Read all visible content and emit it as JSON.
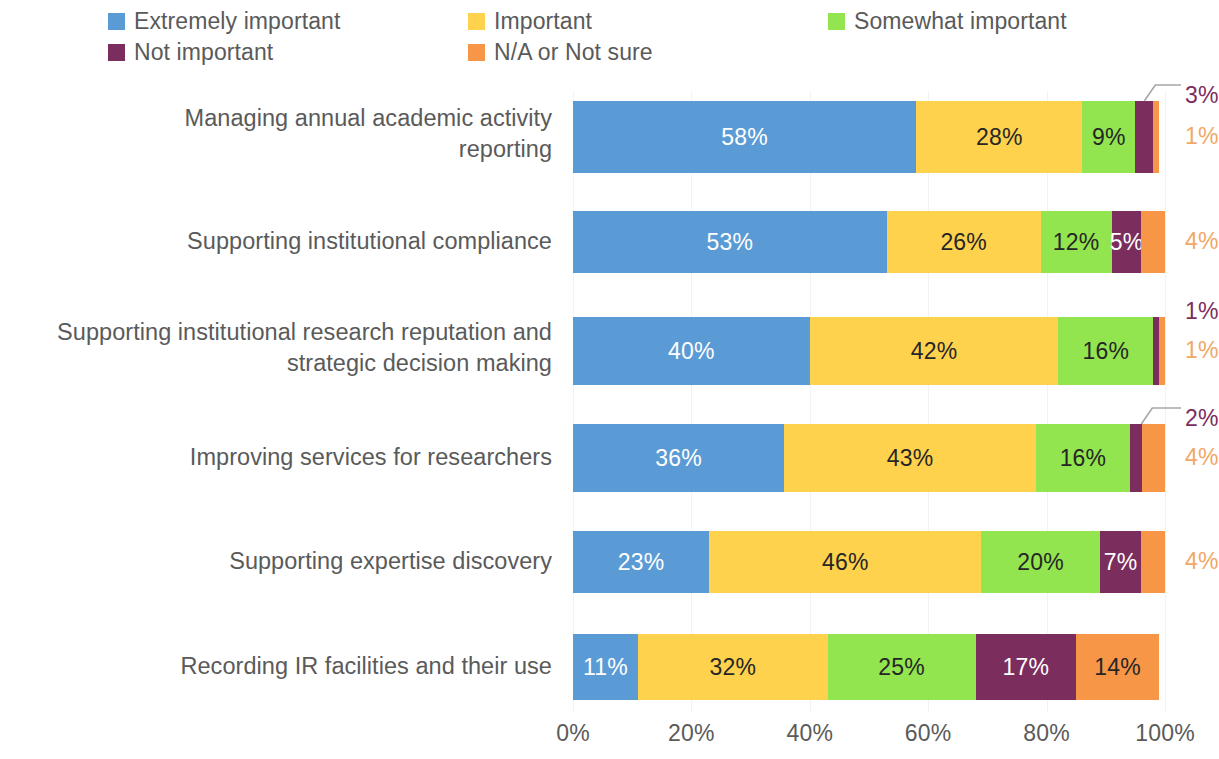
{
  "legend": {
    "items": [
      {
        "label": "Extremely important",
        "color": "#5B9BD5",
        "key": "extremely_important"
      },
      {
        "label": "Important",
        "color": "#FFD24D",
        "key": "important"
      },
      {
        "label": "Somewhat important",
        "color": "#92E54F",
        "key": "somewhat_important"
      },
      {
        "label": "Not important",
        "color": "#7B2D5E",
        "key": "not_important"
      },
      {
        "label": "N/A or Not sure",
        "color": "#F79646",
        "key": "na_not_sure"
      }
    ]
  },
  "axis": {
    "x_ticks": [
      "0%",
      "20%",
      "40%",
      "60%",
      "80%",
      "100%"
    ],
    "x_values": [
      0,
      20,
      40,
      60,
      80,
      100
    ]
  },
  "categories": [
    {
      "label": "Managing annual academic activity reporting"
    },
    {
      "label": "Supporting institutional compliance"
    },
    {
      "label": "Supporting institutional research reputation and strategic decision making"
    },
    {
      "label": "Improving services for researchers"
    },
    {
      "label": "Supporting expertise discovery"
    },
    {
      "label": "Recording IR facilities and their use"
    }
  ],
  "rows": [
    {
      "category": "Managing annual academic activity reporting",
      "segments": [
        {
          "series": "Extremely important",
          "value": 58,
          "text": "58%",
          "placement": "inside",
          "text_color": "#ffffff"
        },
        {
          "series": "Important",
          "value": 28,
          "text": "28%",
          "placement": "inside",
          "text_color": "#262626"
        },
        {
          "series": "Somewhat important",
          "value": 9,
          "text": "9%",
          "placement": "inside",
          "text_color": "#262626"
        },
        {
          "series": "Not important",
          "value": 3,
          "text": "3%",
          "placement": "callout",
          "text_color": "#7B2D5E"
        },
        {
          "series": "N/A or Not sure",
          "value": 1,
          "text": "1%",
          "placement": "outside",
          "text_color": "#F0A868"
        }
      ]
    },
    {
      "category": "Supporting institutional compliance",
      "segments": [
        {
          "series": "Extremely important",
          "value": 53,
          "text": "53%",
          "placement": "inside",
          "text_color": "#ffffff"
        },
        {
          "series": "Important",
          "value": 26,
          "text": "26%",
          "placement": "inside",
          "text_color": "#262626"
        },
        {
          "series": "Somewhat important",
          "value": 12,
          "text": "12%",
          "placement": "inside",
          "text_color": "#262626"
        },
        {
          "series": "Not important",
          "value": 5,
          "text": "5%",
          "placement": "inside",
          "text_color": "#ffffff"
        },
        {
          "series": "N/A or Not sure",
          "value": 4,
          "text": "4%",
          "placement": "outside",
          "text_color": "#F0A868"
        }
      ]
    },
    {
      "category": "Supporting institutional research reputation and strategic decision making",
      "segments": [
        {
          "series": "Extremely important",
          "value": 40,
          "text": "40%",
          "placement": "inside",
          "text_color": "#ffffff"
        },
        {
          "series": "Important",
          "value": 42,
          "text": "42%",
          "placement": "inside",
          "text_color": "#262626"
        },
        {
          "series": "Somewhat important",
          "value": 16,
          "text": "16%",
          "placement": "inside",
          "text_color": "#262626"
        },
        {
          "series": "Not important",
          "value": 1,
          "text": "1%",
          "placement": "outside",
          "text_color": "#7B2D5E"
        },
        {
          "series": "N/A or Not sure",
          "value": 1,
          "text": "1%",
          "placement": "outside",
          "text_color": "#F0A868"
        }
      ]
    },
    {
      "category": "Improving services for researchers",
      "segments": [
        {
          "series": "Extremely important",
          "value": 36,
          "text": "36%",
          "placement": "inside",
          "text_color": "#ffffff"
        },
        {
          "series": "Important",
          "value": 43,
          "text": "43%",
          "placement": "inside",
          "text_color": "#262626"
        },
        {
          "series": "Somewhat important",
          "value": 16,
          "text": "16%",
          "placement": "inside",
          "text_color": "#262626"
        },
        {
          "series": "Not important",
          "value": 2,
          "text": "2%",
          "placement": "callout",
          "text_color": "#7B2D5E"
        },
        {
          "series": "N/A or Not sure",
          "value": 4,
          "text": "4%",
          "placement": "outside",
          "text_color": "#F0A868"
        }
      ]
    },
    {
      "category": "Supporting expertise discovery",
      "segments": [
        {
          "series": "Extremely important",
          "value": 23,
          "text": "23%",
          "placement": "inside",
          "text_color": "#ffffff"
        },
        {
          "series": "Important",
          "value": 46,
          "text": "46%",
          "placement": "inside",
          "text_color": "#262626"
        },
        {
          "series": "Somewhat important",
          "value": 20,
          "text": "20%",
          "placement": "inside",
          "text_color": "#262626"
        },
        {
          "series": "Not important",
          "value": 7,
          "text": "7%",
          "placement": "inside",
          "text_color": "#ffffff"
        },
        {
          "series": "N/A or Not sure",
          "value": 4,
          "text": "4%",
          "placement": "outside",
          "text_color": "#F0A868"
        }
      ]
    },
    {
      "category": "Recording IR facilities and their use",
      "segments": [
        {
          "series": "Extremely important",
          "value": 11,
          "text": "11%",
          "placement": "inside",
          "text_color": "#ffffff"
        },
        {
          "series": "Important",
          "value": 32,
          "text": "32%",
          "placement": "inside",
          "text_color": "#262626"
        },
        {
          "series": "Somewhat important",
          "value": 25,
          "text": "25%",
          "placement": "inside",
          "text_color": "#262626"
        },
        {
          "series": "Not important",
          "value": 17,
          "text": "17%",
          "placement": "inside",
          "text_color": "#ffffff"
        },
        {
          "series": "N/A or Not sure",
          "value": 14,
          "text": "14%",
          "placement": "inside",
          "text_color": "#262626"
        }
      ]
    }
  ],
  "chart_data": {
    "type": "bar",
    "orientation": "horizontal",
    "stacked": true,
    "normalized": true,
    "title": "",
    "subtitle": "",
    "xlabel": "",
    "ylabel": "",
    "xlim": [
      0,
      100
    ],
    "x_tick_labels": [
      "0%",
      "20%",
      "40%",
      "60%",
      "80%",
      "100%"
    ],
    "grid": "vertical",
    "legend_position": "top",
    "categories": [
      "Managing annual academic activity reporting",
      "Supporting institutional compliance",
      "Supporting institutional research reputation and strategic decision making",
      "Improving services for researchers",
      "Supporting expertise discovery",
      "Recording IR facilities and their use"
    ],
    "series": [
      {
        "name": "Extremely important",
        "color": "#5B9BD5",
        "values": [
          58,
          53,
          40,
          36,
          23,
          11
        ]
      },
      {
        "name": "Important",
        "color": "#FFD24D",
        "values": [
          28,
          26,
          42,
          43,
          46,
          32
        ]
      },
      {
        "name": "Somewhat important",
        "color": "#92E54F",
        "values": [
          9,
          12,
          16,
          16,
          20,
          25
        ]
      },
      {
        "name": "Not important",
        "color": "#7B2D5E",
        "values": [
          3,
          5,
          1,
          2,
          7,
          17
        ]
      },
      {
        "name": "N/A or Not sure",
        "color": "#F79646",
        "values": [
          1,
          4,
          1,
          4,
          4,
          14
        ]
      }
    ],
    "annotations": [
      {
        "row": 0,
        "series": "Not important",
        "text": "3%",
        "style": "callout-leader"
      },
      {
        "row": 0,
        "series": "N/A or Not sure",
        "text": "1%",
        "style": "outside"
      },
      {
        "row": 2,
        "series": "Not important",
        "text": "1%",
        "style": "outside"
      },
      {
        "row": 2,
        "series": "N/A or Not sure",
        "text": "1%",
        "style": "outside"
      },
      {
        "row": 3,
        "series": "Not important",
        "text": "2%",
        "style": "callout-leader"
      },
      {
        "row": 3,
        "series": "N/A or Not sure",
        "text": "4%",
        "style": "outside"
      },
      {
        "row": 1,
        "series": "N/A or Not sure",
        "text": "4%",
        "style": "outside"
      },
      {
        "row": 4,
        "series": "N/A or Not sure",
        "text": "4%",
        "style": "outside"
      }
    ]
  }
}
